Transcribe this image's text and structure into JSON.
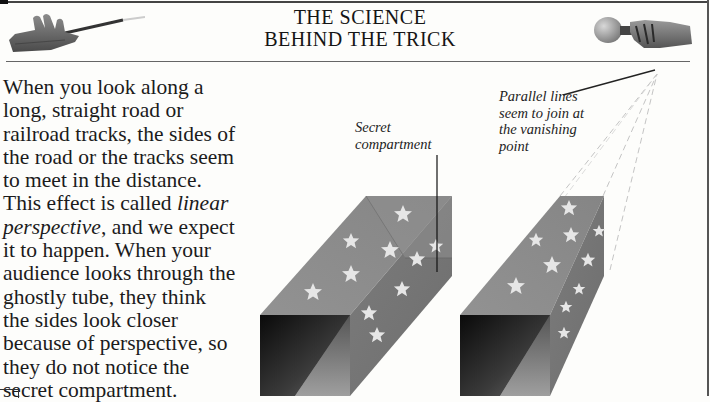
{
  "page": {
    "title_lines": [
      "THE SCIENCE",
      "BEHIND THE TRICK"
    ],
    "colors": {
      "background": "#fdfdfb",
      "rule": "#444444",
      "box_face": "#8a8a8a",
      "box_side": "#7a7a7a",
      "box_interior_dark": "#111111",
      "star": "#e4e4e4",
      "dashed_line": "#c4c4c4"
    }
  },
  "body": {
    "lines": [
      {
        "text": "When you look along a"
      },
      {
        "text": "long, straight road or"
      },
      {
        "text": "railroad tracks, the sides of"
      },
      {
        "text": "the road or the tracks seem"
      },
      {
        "text": "to meet in the distance."
      },
      {
        "pre": "This effect is called ",
        "em": "linear"
      },
      {
        "em": "perspective",
        "post": ", and we expect"
      },
      {
        "text": "it to happen. When your"
      },
      {
        "text": "audience looks through the"
      },
      {
        "text": "ghostly tube, they think"
      },
      {
        "text": "the sides look closer"
      },
      {
        "text": "because of perspective, so"
      },
      {
        "text": "they do not notice the"
      },
      {
        "text": "secret compartment."
      }
    ]
  },
  "labels": {
    "secret_compartment": [
      "Secret",
      "compartment"
    ],
    "parallel_lines": [
      "Parallel lines",
      "seem to join at",
      "the vanishing",
      "point"
    ]
  },
  "illustrations": {
    "left_hand": "hand-holding-wand-icon",
    "right_hand": "hand-holding-bulb-icon",
    "left_box": "tube-with-secret-compartment",
    "right_box": "tube-with-vanishing-point-lines"
  }
}
